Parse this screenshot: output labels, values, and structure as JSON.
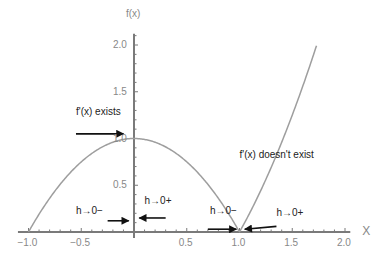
{
  "chart_data": {
    "type": "line",
    "title": "",
    "xlabel": "X",
    "ylabel": "f(x)",
    "function": "f(x) = |1 - x^2|",
    "xlim": [
      -1.0,
      2.0
    ],
    "ylim": [
      0,
      2.1
    ],
    "x_ticks": [
      "-1.0",
      "-0.5",
      "0.5",
      "1.0",
      "1.5",
      "2.0"
    ],
    "y_ticks": [
      "0.5",
      "1.0",
      "1.5",
      "2.0"
    ],
    "grid": false,
    "series": [
      {
        "name": "f(x)",
        "color": "#9e9e9e",
        "x": [
          -1.0,
          -0.75,
          -0.5,
          -0.25,
          0.0,
          0.25,
          0.5,
          0.75,
          1.0,
          1.25,
          1.5,
          1.73
        ],
        "values": [
          0.0,
          0.4375,
          0.75,
          0.9375,
          1.0,
          0.9375,
          0.75,
          0.4375,
          0.0,
          0.5625,
          1.25,
          2.0
        ]
      }
    ],
    "annotations": [
      {
        "text": "f'(x) exists",
        "x": -0.55,
        "y": 1.28
      },
      {
        "text": "f'(x) doesn't exist",
        "x": 1.0,
        "y": 0.82
      },
      {
        "text": "h→0−",
        "x": -0.55,
        "y": 0.22
      },
      {
        "text": "h→0+",
        "x": 0.1,
        "y": 0.33
      },
      {
        "text": "h→0−",
        "x": 0.72,
        "y": 0.22
      },
      {
        "text": "h→0+",
        "x": 1.35,
        "y": 0.2
      }
    ],
    "arrows": [
      {
        "from": [
          -0.55,
          1.05
        ],
        "to": [
          -0.1,
          1.05
        ],
        "direction": "right"
      },
      {
        "from": [
          -0.25,
          0.12
        ],
        "to": [
          -0.05,
          0.12
        ],
        "direction": "right"
      },
      {
        "from": [
          0.3,
          0.15
        ],
        "to": [
          0.05,
          0.15
        ],
        "direction": "left"
      },
      {
        "from": [
          0.7,
          0.03
        ],
        "to": [
          0.97,
          0.03
        ],
        "direction": "right"
      },
      {
        "from": [
          1.35,
          0.06
        ],
        "to": [
          1.05,
          0.03
        ],
        "direction": "left"
      }
    ]
  }
}
